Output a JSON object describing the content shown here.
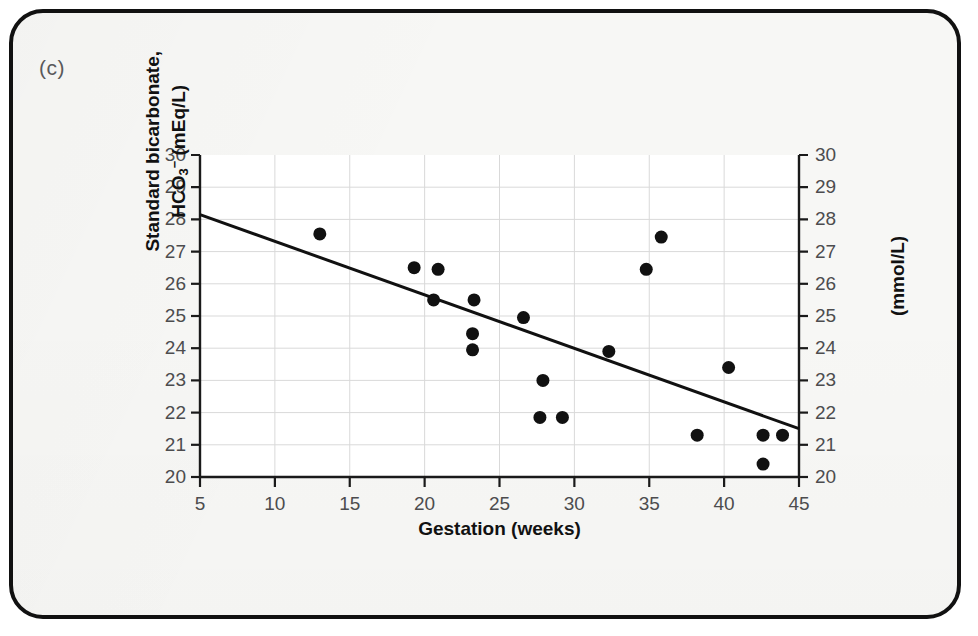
{
  "figure": {
    "panel_label": "(c)",
    "frame_color": "#111111",
    "background_color": "#f7f7f5"
  },
  "chart_data": {
    "type": "scatter",
    "title": "",
    "xlabel": "Gestation (weeks)",
    "ylabel": "Standard bicarbonate, HCO3- (mEq/L)",
    "ylabel_secondary": "(mmol/L)",
    "ylabel_parts": {
      "line1": "Standard bicarbonate,",
      "line2_pre": "HCO",
      "line2_sub": "3",
      "line2_sup": "−",
      "line2_post": " (mEq/L)"
    },
    "xlim": [
      5,
      45
    ],
    "ylim": [
      20,
      30
    ],
    "xticks": [
      5,
      10,
      15,
      20,
      25,
      30,
      35,
      40,
      45
    ],
    "yticks": [
      20,
      21,
      22,
      23,
      24,
      25,
      26,
      27,
      28,
      29,
      30
    ],
    "yticks_secondary": [
      20,
      21,
      22,
      23,
      24,
      25,
      26,
      27,
      28,
      29,
      30
    ],
    "grid": true,
    "grid_color": "#d9d9d9",
    "legend": "none",
    "marker_color": "#111111",
    "marker_size_px": 13,
    "points": [
      {
        "x": 13.0,
        "y": 27.55
      },
      {
        "x": 19.3,
        "y": 26.5
      },
      {
        "x": 20.9,
        "y": 26.45
      },
      {
        "x": 20.6,
        "y": 25.5
      },
      {
        "x": 23.3,
        "y": 25.5
      },
      {
        "x": 23.2,
        "y": 24.45
      },
      {
        "x": 23.2,
        "y": 23.95
      },
      {
        "x": 26.6,
        "y": 24.95
      },
      {
        "x": 27.9,
        "y": 23.0
      },
      {
        "x": 27.7,
        "y": 21.85
      },
      {
        "x": 29.2,
        "y": 21.85
      },
      {
        "x": 32.3,
        "y": 23.9
      },
      {
        "x": 34.8,
        "y": 26.45
      },
      {
        "x": 35.8,
        "y": 27.45
      },
      {
        "x": 38.2,
        "y": 21.3
      },
      {
        "x": 40.3,
        "y": 23.4
      },
      {
        "x": 42.6,
        "y": 21.3
      },
      {
        "x": 43.9,
        "y": 21.3
      },
      {
        "x": 42.6,
        "y": 20.4
      }
    ],
    "trend_line": {
      "type": "linear-regression",
      "x_start": 5,
      "y_start": 28.15,
      "x_end": 45,
      "y_end": 21.5,
      "color": "#111111",
      "width_px": 3
    }
  }
}
